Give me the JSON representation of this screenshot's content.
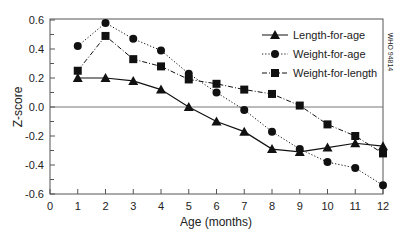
{
  "chart_data": {
    "type": "line",
    "title": "",
    "xlabel": "Age (months)",
    "ylabel": "Z-score",
    "xlim": [
      0,
      12
    ],
    "ylim": [
      -0.6,
      0.6
    ],
    "x_ticks": [
      "0",
      "1",
      "2",
      "3",
      "4",
      "5",
      "6",
      "7",
      "8",
      "9",
      "10",
      "11",
      "12"
    ],
    "y_ticks": [
      "0.6",
      "0.4",
      "0.2",
      "0.0",
      "-0.2",
      "-0.4",
      "-0.6"
    ],
    "y_tick_values": [
      0.6,
      0.4,
      0.2,
      0.0,
      -0.2,
      -0.4,
      -0.6
    ],
    "grid": false,
    "reference_line": 0.0,
    "legend_position": "upper right",
    "x": [
      1,
      2,
      3,
      4,
      5,
      6,
      7,
      8,
      9,
      10,
      11,
      12
    ],
    "series": [
      {
        "name": "Length-for-age",
        "marker": "triangle",
        "line_style": "solid",
        "values": [
          0.2,
          0.2,
          0.18,
          0.12,
          0.0,
          -0.1,
          -0.17,
          -0.29,
          -0.31,
          -0.28,
          -0.25,
          -0.27
        ]
      },
      {
        "name": "Weight-for-age",
        "marker": "circle",
        "line_style": "dotted",
        "values": [
          0.42,
          0.58,
          0.47,
          0.39,
          0.23,
          0.1,
          -0.02,
          -0.17,
          -0.29,
          -0.38,
          -0.42,
          -0.54
        ]
      },
      {
        "name": "Weight-for-length",
        "marker": "square",
        "line_style": "dash-dot",
        "values": [
          0.25,
          0.49,
          0.33,
          0.28,
          0.19,
          0.16,
          0.12,
          0.09,
          0.01,
          -0.12,
          -0.2,
          -0.32
        ]
      }
    ],
    "annotations": [
      "WHO 94814"
    ]
  },
  "colors": {
    "axis": "#555555",
    "series": "#111111",
    "zero_line": "#777777"
  }
}
